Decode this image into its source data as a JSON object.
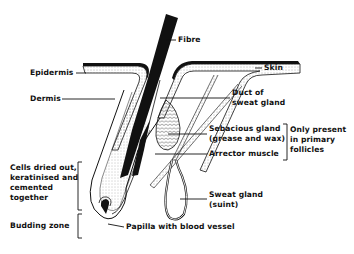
{
  "diagram": {
    "labels": {
      "fibre": "Fibre",
      "skin": "Skin",
      "epidermis": "Epidermis",
      "dermis": "Dermis",
      "duct_line1": "Duct of",
      "duct_line2": "sweat gland",
      "sebaceous_line1": "Sebacious gland",
      "sebaceous_line2": "(grease and wax)",
      "arrector": "Arrector muscle",
      "primary_line1": "Only present",
      "primary_line2": "in primary",
      "primary_line3": "follicles",
      "sweat_line1": "Sweat gland",
      "sweat_line2": "(suint)",
      "cells_line1": "Cells dried out,",
      "cells_line2": "keratinised and",
      "cells_line3": "cemented",
      "cells_line4": "together",
      "budding": "Budding zone",
      "papilla": "Papilla with blood vessel"
    },
    "colors": {
      "ink": "#111111",
      "background": "#ffffff",
      "stipple": "#777777"
    }
  }
}
